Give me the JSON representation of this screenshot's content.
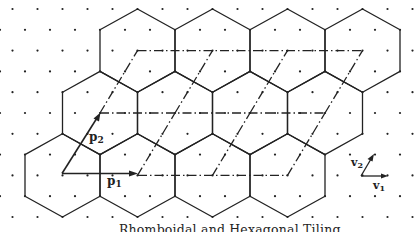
{
  "figure": {
    "caption": "Rhomboidal and Hexagonal Tiling",
    "large_basis": {
      "p1": {
        "letter": "p",
        "subscript": "1"
      },
      "p2": {
        "letter": "p",
        "subscript": "2"
      }
    },
    "small_basis": {
      "v1": {
        "letter": "v",
        "subscript": "1"
      },
      "v2": {
        "letter": "v",
        "subscript": "2"
      }
    },
    "hexagon_grid": {
      "rows": 3,
      "hexagons_per_row": 4
    },
    "rhombus_grid": {
      "rows": 2,
      "rhombi_per_row": 3
    },
    "colors": {
      "ink": "#222222",
      "background": "#ffffff"
    }
  }
}
